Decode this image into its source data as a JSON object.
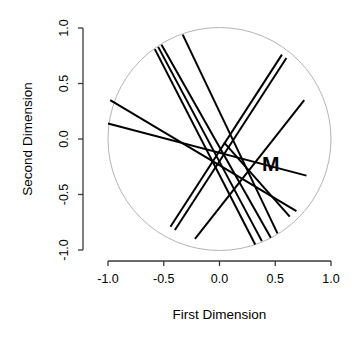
{
  "chart_data": {
    "type": "scatter",
    "title": "",
    "subtitle": "",
    "xlabel": "First Dimension",
    "ylabel": "Second Dimension",
    "xlim": [
      -1.0,
      1.0
    ],
    "ylim": [
      -1.0,
      1.0
    ],
    "grid": false,
    "legend": null,
    "xticks": [
      "-1.0",
      "-0.5",
      "0.0",
      "0.5",
      "1.0"
    ],
    "xtick_values": [
      -1.0,
      -0.5,
      0.0,
      0.5,
      1.0
    ],
    "yticks": [
      "-1.0",
      "-0.5",
      "0.0",
      "0.5",
      "1.0"
    ],
    "ytick_values": [
      -1.0,
      -0.5,
      0.0,
      0.5,
      1.0
    ],
    "unit_circle": {
      "center": [
        0.0,
        0.0
      ],
      "radius": 1.0,
      "color": "#b4b4b4",
      "stroke_width": 1.0
    },
    "line_color": "#000000",
    "line_width": 2.0,
    "direction_lines": [
      {
        "id": "line-1",
        "x1": -0.33,
        "y1": 0.94,
        "x2": 0.52,
        "y2": -0.85
      },
      {
        "id": "line-2",
        "x1": -0.52,
        "y1": 0.85,
        "x2": 0.46,
        "y2": -0.89
      },
      {
        "id": "line-3",
        "x1": -0.55,
        "y1": 0.83,
        "x2": 0.38,
        "y2": -0.92
      },
      {
        "id": "line-4",
        "x1": -0.58,
        "y1": 0.81,
        "x2": 0.32,
        "y2": -0.95
      },
      {
        "id": "line-5",
        "x1": -0.98,
        "y1": 0.35,
        "x2": 0.69,
        "y2": -0.65
      },
      {
        "id": "line-6",
        "x1": -1.0,
        "y1": 0.14,
        "x2": 0.78,
        "y2": -0.33
      },
      {
        "id": "line-7",
        "x1": 0.56,
        "y1": 0.76,
        "x2": -0.44,
        "y2": -0.79
      },
      {
        "id": "line-8",
        "x1": 0.6,
        "y1": 0.73,
        "x2": -0.4,
        "y2": -0.82
      },
      {
        "id": "line-9",
        "x1": 0.76,
        "y1": 0.35,
        "x2": -0.22,
        "y2": -0.9
      },
      {
        "id": "line-10",
        "x1": 0.63,
        "y1": -0.7,
        "x2": 0.04,
        "y2": -0.03
      }
    ],
    "point_labels": [
      {
        "text": "M",
        "x": 0.46,
        "y": -0.24
      }
    ]
  },
  "plot": {
    "xaxis_label": "First Dimension",
    "yaxis_label": "Second Dimension",
    "label_m": "M",
    "colors": {
      "circle": "#b4b4b4",
      "lines": "#000000",
      "axis": "#000000",
      "text": "#000000",
      "background": "#ffffff"
    }
  }
}
